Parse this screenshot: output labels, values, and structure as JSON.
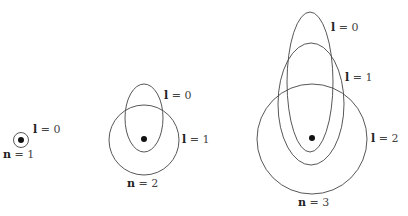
{
  "diagram": {
    "type": "Bohr-Sommerfeld electron orbits",
    "colors": {
      "stroke": "#444444",
      "nucleus": "#111111",
      "text": "#444444"
    },
    "groups": [
      {
        "n_label": {
          "sym": "n",
          "eq": " = 1"
        },
        "orbits": [
          {
            "l_label": {
              "sym": "l",
              "eq": " = 0"
            },
            "shape": "circle"
          }
        ]
      },
      {
        "n_label": {
          "sym": "n",
          "eq": " = 2"
        },
        "orbits": [
          {
            "l_label": {
              "sym": "l",
              "eq": " = 0"
            },
            "shape": "ellipse"
          },
          {
            "l_label": {
              "sym": "l",
              "eq": " = 1"
            },
            "shape": "circle"
          }
        ]
      },
      {
        "n_label": {
          "sym": "n",
          "eq": " = 3"
        },
        "orbits": [
          {
            "l_label": {
              "sym": "l",
              "eq": " = 0"
            },
            "shape": "ellipse"
          },
          {
            "l_label": {
              "sym": "l",
              "eq": " = 1"
            },
            "shape": "ellipse"
          },
          {
            "l_label": {
              "sym": "l",
              "eq": " = 2"
            },
            "shape": "circle"
          }
        ]
      }
    ]
  }
}
